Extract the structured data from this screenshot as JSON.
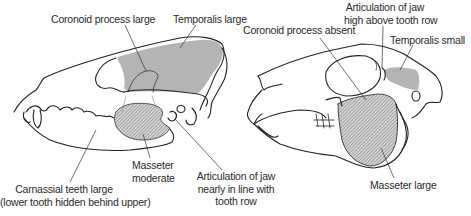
{
  "diagram": {
    "colors": {
      "outline": "#222222",
      "temporalis_fill": "#b4b4b4",
      "masseter_fill": "#a8a8a8",
      "label_text": "#2a2a2a",
      "leader_line": "#333333"
    },
    "left_skull": {
      "type": "carnivore",
      "labels": {
        "coronoid": "Coronoid process large",
        "temporalis": "Temporalis large",
        "masseter_line1": "Masseter",
        "masseter_line2": "moderate",
        "articulation_line1": "Articulation of jaw",
        "articulation_line2": "nearly in line with",
        "articulation_line3": "tooth row",
        "carnassial_line1": "Carnassial teeth large",
        "carnassial_line2": "(lower tooth hidden behind upper)"
      }
    },
    "right_skull": {
      "type": "herbivore",
      "labels": {
        "articulation_line1": "Articulation of jaw",
        "articulation_line2": "high above tooth row",
        "coronoid": "Coronoid process absent",
        "temporalis": "Temporalis small",
        "masseter": "Masseter large"
      }
    }
  }
}
